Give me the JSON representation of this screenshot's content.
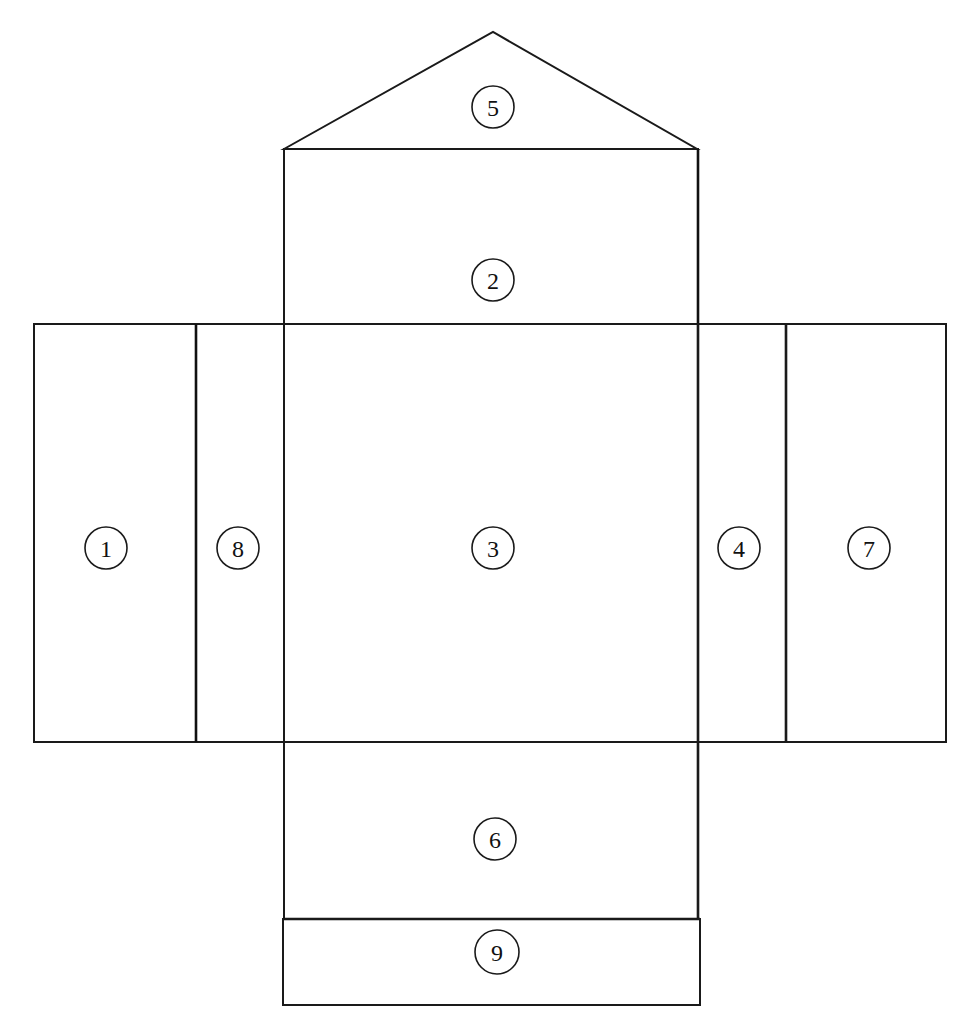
{
  "diagram": {
    "type": "box net (unfolded box template)",
    "stroke_color": "#1a1a1a",
    "background": "#ffffff",
    "panels": [
      {
        "id": "1",
        "label": "1",
        "shape": "rectangle",
        "position": "far-left"
      },
      {
        "id": "2",
        "label": "2",
        "shape": "rectangle",
        "position": "top-center"
      },
      {
        "id": "3",
        "label": "3",
        "shape": "rectangle",
        "position": "center"
      },
      {
        "id": "4",
        "label": "4",
        "shape": "rectangle",
        "position": "right-narrow"
      },
      {
        "id": "5",
        "label": "5",
        "shape": "triangle",
        "position": "top-flap"
      },
      {
        "id": "6",
        "label": "6",
        "shape": "rectangle",
        "position": "bottom-center"
      },
      {
        "id": "7",
        "label": "7",
        "shape": "rectangle",
        "position": "far-right"
      },
      {
        "id": "8",
        "label": "8",
        "shape": "rectangle",
        "position": "left-narrow"
      },
      {
        "id": "9",
        "label": "9",
        "shape": "rectangle",
        "position": "bottom-flap"
      }
    ]
  }
}
